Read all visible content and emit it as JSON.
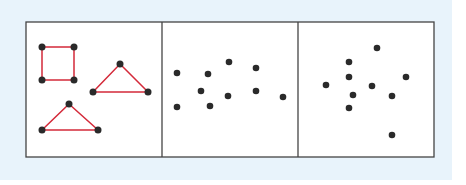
{
  "figure": {
    "background_color": "#e8f3fb",
    "panel_fill": "#ffffff",
    "border_color": "#444444",
    "dot_color": "#2a2a2a",
    "line_color": "#d42a3a",
    "frame": {
      "x": 26,
      "y": 22,
      "width": 408,
      "height": 135
    },
    "dividers_x": [
      162,
      298
    ],
    "panels": [
      {
        "name": "connected-shapes",
        "shapes": [
          {
            "type": "square",
            "points": [
              [
                42,
                47
              ],
              [
                74,
                47
              ],
              [
                74,
                80
              ],
              [
                42,
                80
              ]
            ]
          },
          {
            "type": "triangle",
            "points": [
              [
                120,
                64
              ],
              [
                148,
                92
              ],
              [
                93,
                92
              ]
            ]
          },
          {
            "type": "triangle",
            "points": [
              [
                69,
                104
              ],
              [
                98,
                130
              ],
              [
                42,
                130
              ]
            ]
          }
        ]
      },
      {
        "name": "scattered-dots-a",
        "dots": [
          [
            177,
            73
          ],
          [
            208,
            74
          ],
          [
            229,
            62
          ],
          [
            256,
            68
          ],
          [
            201,
            91
          ],
          [
            228,
            96
          ],
          [
            256,
            91
          ],
          [
            283,
            97
          ],
          [
            177,
            107
          ],
          [
            210,
            106
          ]
        ]
      },
      {
        "name": "scattered-dots-b",
        "dots": [
          [
            377,
            48
          ],
          [
            349,
            62
          ],
          [
            349,
            77
          ],
          [
            326,
            85
          ],
          [
            372,
            86
          ],
          [
            406,
            77
          ],
          [
            353,
            95
          ],
          [
            392,
            96
          ],
          [
            349,
            108
          ],
          [
            392,
            135
          ]
        ]
      }
    ]
  }
}
